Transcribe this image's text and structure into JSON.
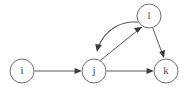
{
  "diagram": {
    "type": "directed-graph",
    "background_color": "#ffffff",
    "node_stroke_color": "#6f6f6f",
    "node_fill_color": "#ffffff",
    "edge_color": "#5a5a5a",
    "arrow_color": "#3a3a3a",
    "label_color": "#4a4a4a",
    "width": 189,
    "height": 94,
    "nodes": [
      {
        "id": "i",
        "label": "i",
        "cx": 22,
        "cy": 71,
        "r": 12
      },
      {
        "id": "j",
        "label": "j",
        "cx": 94,
        "cy": 71,
        "r": 12
      },
      {
        "id": "l",
        "label": "l",
        "cx": 149,
        "cy": 16,
        "r": 12
      },
      {
        "id": "k",
        "label": "k",
        "cx": 166,
        "cy": 71,
        "r": 12
      }
    ],
    "edges": [
      {
        "id": "i-to-j",
        "from": "i",
        "to": "j",
        "shape": "straight",
        "direction": "rightward"
      },
      {
        "id": "j-to-k",
        "from": "j",
        "to": "k",
        "shape": "straight",
        "direction": "rightward"
      },
      {
        "id": "j-to-l",
        "from": "j",
        "to": "l",
        "shape": "straight",
        "direction": "up-right"
      },
      {
        "id": "l-to-j",
        "from": "l",
        "to": "j",
        "shape": "curved",
        "direction": "down-left"
      },
      {
        "id": "l-to-k",
        "from": "l",
        "to": "k",
        "shape": "straight",
        "direction": "down-right"
      }
    ]
  }
}
